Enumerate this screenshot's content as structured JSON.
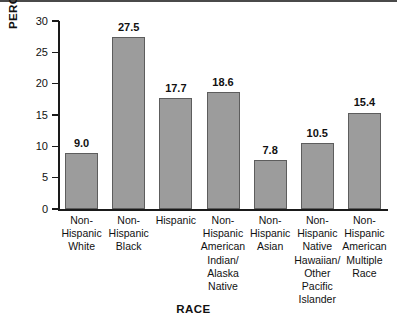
{
  "chart_data": {
    "type": "bar",
    "title": "",
    "subtitle": "",
    "xlabel": "RACE",
    "ylabel": "PERCENT OF WOMEN",
    "ylim": [
      0,
      30
    ],
    "yticks": [
      0,
      5,
      10,
      15,
      20,
      25,
      30
    ],
    "ytick_labels": [
      "0",
      "5",
      "10",
      "15",
      "20",
      "25",
      "30"
    ],
    "grid": false,
    "legend": null,
    "bar_color": "#9c9c9c",
    "bar_edge_color": "#5d5d5d",
    "categories": [
      "Non-\nHispanic\nWhite",
      "Non-\nHispanic\nBlack",
      "Hispanic",
      "Non-\nHispanic\nAmerican\nIndian/\nAlaska\nNative",
      "Non-\nHispanic\nAsian",
      "Non-\nHispanic\nNative\nHawaiian/\nOther\nPacific\nIslander",
      "Non-\nHispanic\nAmerican\nMultiple\nRace"
    ],
    "values": [
      9.0,
      27.5,
      17.7,
      18.6,
      7.8,
      10.5,
      15.4
    ],
    "data_labels": [
      "9.0",
      "27.5",
      "17.7",
      "18.6",
      "7.8",
      "10.5",
      "15.4"
    ]
  }
}
